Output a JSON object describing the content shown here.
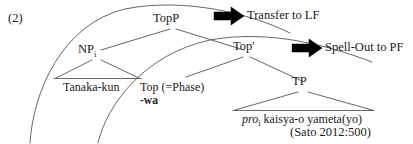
{
  "figure": {
    "example_number": "(2)",
    "citation": "(Sato 2012:500)"
  },
  "tree": {
    "nodes": [
      {
        "id": "topp",
        "label": "TopP",
        "sub": ""
      },
      {
        "id": "np",
        "label": "NP",
        "sub": "i"
      },
      {
        "id": "topbar",
        "label": "Top'",
        "sub": ""
      },
      {
        "id": "tp",
        "label": "TP",
        "sub": ""
      }
    ],
    "terminals": [
      {
        "id": "np-terminal",
        "text": "Tanaka-kun"
      },
      {
        "id": "tp-terminal_pro",
        "text": "pro"
      },
      {
        "id": "tp-terminal_pro_sub",
        "text": "i"
      },
      {
        "id": "tp-terminal_rest",
        "text": " kaisya-o yameta(yo)"
      }
    ],
    "head": {
      "label": "Top (=Phase)",
      "feature": "-wa"
    }
  },
  "operations": [
    {
      "id": "transfer",
      "label": "Transfer to LF",
      "arrow": "right-block-arrow-icon"
    },
    {
      "id": "spellout",
      "label": "Spell-Out to PF",
      "arrow": "right-block-arrow-icon"
    }
  ],
  "colors": {
    "ink": "#1a1a1a",
    "line": "#555555",
    "arrow": "#000000",
    "background": "#ffffff"
  }
}
